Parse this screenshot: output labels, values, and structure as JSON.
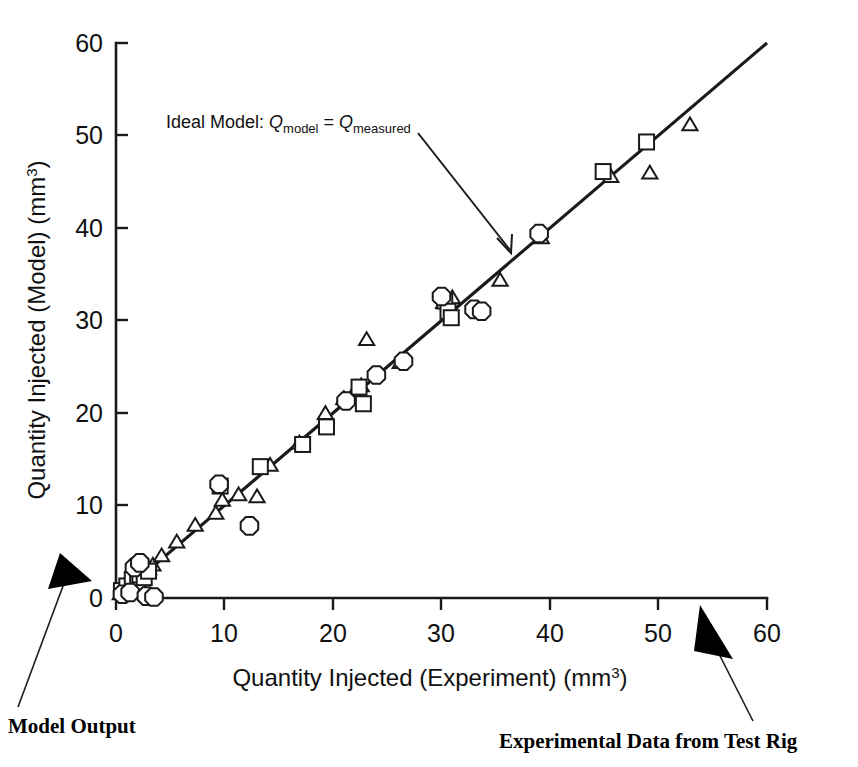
{
  "chart_data": {
    "type": "scatter",
    "title": "",
    "xlabel": "Quantity Injected (Experiment) (mm3)",
    "xlabel_main": "Quantity Injected (Experiment) (mm",
    "xlabel_sup": "3",
    "xlabel_tail": ")",
    "ylabel": "Quantity Injected (Model) (mm3)",
    "ylabel_main": "Quantity Injected (Model) (mm",
    "ylabel_sup": "3",
    "ylabel_tail": ")",
    "xlim": [
      0,
      60
    ],
    "ylim": [
      0,
      60
    ],
    "xticks": [
      0,
      10,
      20,
      30,
      40,
      50,
      60
    ],
    "yticks": [
      0,
      10,
      20,
      30,
      40,
      50,
      60
    ],
    "xtick_labels": [
      "0",
      "10",
      "20",
      "30",
      "40",
      "50",
      "60"
    ],
    "ytick_labels": [
      "0",
      "10",
      "20",
      "30",
      "40",
      "50",
      "60"
    ],
    "grid": false,
    "legend": "none",
    "reference_line": {
      "name": "Ideal Model",
      "equation": "Qmodel = Qmeasured",
      "from": [
        0,
        0
      ],
      "to": [
        60,
        60
      ],
      "style": "solid"
    },
    "series": [
      {
        "name": "triangle-series",
        "marker": "triangle",
        "points": [
          [
            0.4,
            0.5
          ],
          [
            0.8,
            1.1
          ],
          [
            1.2,
            1.5
          ],
          [
            1.6,
            1.0
          ],
          [
            1.8,
            2.2
          ],
          [
            2.0,
            2.6
          ],
          [
            2.3,
            3.0
          ],
          [
            2.6,
            3.4
          ],
          [
            3.0,
            3.2
          ],
          [
            3.4,
            3.6
          ],
          [
            4.2,
            4.6
          ],
          [
            5.6,
            6.1
          ],
          [
            7.3,
            7.9
          ],
          [
            9.2,
            9.2
          ],
          [
            9.8,
            10.6
          ],
          [
            11.3,
            11.2
          ],
          [
            13.0,
            11.0
          ],
          [
            14.2,
            14.4
          ],
          [
            16.9,
            16.8
          ],
          [
            19.3,
            20.0
          ],
          [
            21.0,
            21.6
          ],
          [
            22.1,
            22.6
          ],
          [
            22.6,
            23.0
          ],
          [
            23.1,
            28.0
          ],
          [
            26.2,
            25.5
          ],
          [
            30.2,
            32.0
          ],
          [
            31.0,
            32.5
          ],
          [
            35.4,
            34.4
          ],
          [
            39.2,
            39.0
          ],
          [
            45.6,
            45.6
          ],
          [
            49.2,
            46.0
          ],
          [
            52.9,
            51.2
          ]
        ]
      },
      {
        "name": "square-series",
        "marker": "square",
        "points": [
          [
            0.5,
            0.8
          ],
          [
            1.0,
            1.3
          ],
          [
            1.5,
            2.0
          ],
          [
            2.0,
            1.6
          ],
          [
            2.2,
            2.5
          ],
          [
            2.6,
            2.2
          ],
          [
            3.0,
            2.9
          ],
          [
            9.6,
            12.1
          ],
          [
            13.3,
            14.2
          ],
          [
            17.2,
            16.6
          ],
          [
            19.4,
            18.5
          ],
          [
            22.4,
            22.8
          ],
          [
            22.8,
            21.0
          ],
          [
            30.3,
            32.1
          ],
          [
            30.6,
            31.0
          ],
          [
            30.9,
            30.3
          ],
          [
            44.9,
            46.1
          ],
          [
            48.9,
            49.3
          ]
        ]
      },
      {
        "name": "octagon-series",
        "marker": "octagon",
        "points": [
          [
            0.6,
            0.4
          ],
          [
            1.3,
            0.6
          ],
          [
            1.7,
            3.3
          ],
          [
            2.2,
            3.8
          ],
          [
            2.8,
            0.2
          ],
          [
            3.5,
            0.1
          ],
          [
            9.5,
            12.3
          ],
          [
            12.3,
            7.8
          ],
          [
            21.2,
            21.3
          ],
          [
            24.0,
            24.1
          ],
          [
            26.5,
            25.6
          ],
          [
            30.0,
            32.6
          ],
          [
            33.0,
            31.2
          ],
          [
            33.7,
            31.0
          ],
          [
            39.0,
            39.4
          ]
        ]
      }
    ],
    "annotations": [
      {
        "name": "ideal-model-annotation",
        "text_prefix": "Ideal Model: ",
        "q1": "Q",
        "sub1": "model",
        "eq": " = ",
        "q2": "Q",
        "sub2": "measured",
        "arrow_from": [
          2.8,
          55.0
        ],
        "arrow_to": [
          36.5,
          37.3
        ]
      },
      {
        "name": "model-output-callout",
        "text": "Model Output"
      },
      {
        "name": "experimental-data-callout",
        "text": "Experimental Data from Test Rig"
      }
    ],
    "colors": {
      "axis": "#1a1a1a",
      "marker_stroke": "#1a1a1a",
      "marker_fill": "#ffffff",
      "line": "#1a1a1a",
      "arrow_solid": "#000000",
      "background": "#ffffff"
    }
  }
}
